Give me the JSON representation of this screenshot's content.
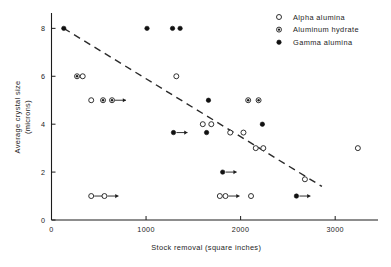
{
  "chart_data": {
    "type": "scatter",
    "title": "",
    "xlabel": "Stock removal (square inches)",
    "ylabel_line1": "Average crystal size",
    "ylabel_line2": "(microns)",
    "xlim": [
      0,
      3400
    ],
    "ylim": [
      0,
      8.6
    ],
    "xticks": [
      0,
      1000,
      2000,
      3000
    ],
    "xtick_labels": [
      "0",
      "1000",
      "2000",
      "3000"
    ],
    "yticks": [
      0,
      2,
      4,
      6,
      8
    ],
    "ytick_labels": [
      "0",
      "2",
      "4",
      "6",
      "8"
    ],
    "grid": false,
    "legend_position": "top-right",
    "legend": [
      {
        "label": "Alpha alumina",
        "marker": "open-circle"
      },
      {
        "label": "Aluminum hydrate",
        "marker": "half-filled-circle"
      },
      {
        "label": "Gamma alumina",
        "marker": "filled-circle"
      }
    ],
    "annotations": [
      {
        "type": "trend-line",
        "style": "dashed",
        "x1": 130,
        "y1": 8.0,
        "x2": 2860,
        "y2": 1.4
      }
    ],
    "series": [
      {
        "name": "Alpha alumina",
        "marker": "open-circle",
        "points": [
          {
            "x": 330,
            "y": 6.0
          },
          {
            "x": 420,
            "y": 5.0
          },
          {
            "x": 1320,
            "y": 6.0
          },
          {
            "x": 1600,
            "y": 4.0
          },
          {
            "x": 1690,
            "y": 4.0
          },
          {
            "x": 1890,
            "y": 3.65
          },
          {
            "x": 2030,
            "y": 3.65
          },
          {
            "x": 2160,
            "y": 3.0
          },
          {
            "x": 2240,
            "y": 3.0
          },
          {
            "x": 3240,
            "y": 3.0
          },
          {
            "x": 2680,
            "y": 1.7
          },
          {
            "x": 420,
            "y": 1.0,
            "arrow": "right"
          },
          {
            "x": 560,
            "y": 1.0,
            "arrow": "right"
          },
          {
            "x": 1780,
            "y": 1.0
          },
          {
            "x": 1840,
            "y": 1.0,
            "arrow": "right"
          },
          {
            "x": 2110,
            "y": 1.0
          }
        ]
      },
      {
        "name": "Aluminum hydrate",
        "marker": "half-filled-circle",
        "points": [
          {
            "x": 270,
            "y": 6.0
          },
          {
            "x": 545,
            "y": 5.0
          },
          {
            "x": 640,
            "y": 5.0,
            "arrow": "right"
          },
          {
            "x": 2080,
            "y": 5.0
          },
          {
            "x": 2190,
            "y": 5.0
          }
        ]
      },
      {
        "name": "Gamma alumina",
        "marker": "filled-circle",
        "points": [
          {
            "x": 130,
            "y": 8.0
          },
          {
            "x": 1010,
            "y": 8.0
          },
          {
            "x": 1280,
            "y": 8.0
          },
          {
            "x": 1360,
            "y": 8.0
          },
          {
            "x": 1660,
            "y": 5.0
          },
          {
            "x": 2230,
            "y": 4.0
          },
          {
            "x": 1290,
            "y": 3.65,
            "arrow": "right"
          },
          {
            "x": 1640,
            "y": 3.65
          },
          {
            "x": 1810,
            "y": 2.0,
            "arrow": "right"
          },
          {
            "x": 2590,
            "y": 1.0,
            "arrow": "right"
          }
        ]
      }
    ]
  }
}
